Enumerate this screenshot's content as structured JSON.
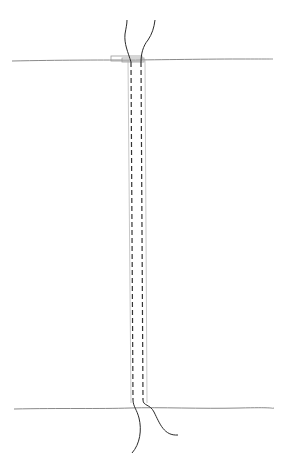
{
  "diagram": {
    "colors": {
      "background": "#ffffff",
      "surface_line": "#8a8a8a",
      "conduit_dash": "#333333",
      "conduit_outline": "#9a9a9a",
      "cable": "#2a2a2a"
    },
    "top_surface_y": 60,
    "bottom_surface_y": 408
  }
}
